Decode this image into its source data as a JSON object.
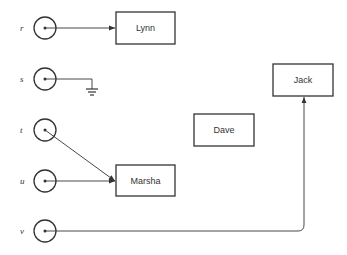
{
  "diagram": {
    "colors": {
      "stroke": "#333333",
      "background": "#ffffff",
      "text": "#333333"
    },
    "sources": [
      {
        "id": "r",
        "label": "r",
        "cx": 45,
        "cy": 28,
        "target": "Lynn"
      },
      {
        "id": "s",
        "label": "s",
        "cx": 45,
        "cy": 79,
        "target": "ground"
      },
      {
        "id": "t",
        "label": "t",
        "cx": 45,
        "cy": 130,
        "target": "Marsha"
      },
      {
        "id": "u",
        "label": "u",
        "cx": 45,
        "cy": 181,
        "target": "Marsha"
      },
      {
        "id": "v",
        "label": "v",
        "cx": 45,
        "cy": 231,
        "target": "Jack"
      }
    ],
    "boxes": [
      {
        "id": "lynn",
        "label": "Lynn",
        "x": 116,
        "y": 12,
        "w": 59,
        "h": 32
      },
      {
        "id": "jack",
        "label": "Jack",
        "x": 273,
        "y": 64,
        "w": 60,
        "h": 32
      },
      {
        "id": "dave",
        "label": "Dave",
        "x": 194,
        "y": 114,
        "w": 60,
        "h": 32
      },
      {
        "id": "marsha",
        "label": "Marsha",
        "x": 116,
        "y": 165,
        "w": 59,
        "h": 31
      }
    ],
    "ground_symbol": "ground-icon"
  }
}
